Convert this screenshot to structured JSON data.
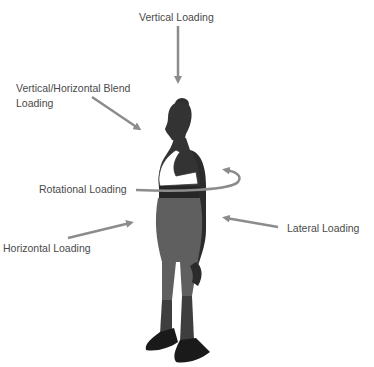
{
  "diagram": {
    "labels": {
      "vertical": "Vertical Loading",
      "blend_line1": "Vertical/Horizontal Blend",
      "blend_line2": "Loading",
      "rotational": "Rotational Loading",
      "lateral": "Lateral Loading",
      "horizontal": "Horizontal Loading"
    },
    "colors": {
      "arrow": "#8c8c8c",
      "skin": "#333333",
      "leggings": "#5f5f5f",
      "shoes": "#1a1a1a",
      "bra": "#ffffff",
      "text": "#4a4a4a"
    }
  }
}
